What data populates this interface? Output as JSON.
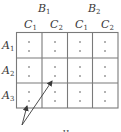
{
  "diagram": {
    "top_headers": [
      {
        "letter": "B",
        "sub": "1"
      },
      {
        "letter": "B",
        "sub": "2"
      }
    ],
    "sub_headers": [
      {
        "letter": "C",
        "sub": "1"
      },
      {
        "letter": "C",
        "sub": "2"
      },
      {
        "letter": "C",
        "sub": "1"
      },
      {
        "letter": "C",
        "sub": "2"
      }
    ],
    "row_headers": [
      {
        "letter": "A",
        "sub": "1"
      },
      {
        "letter": "A",
        "sub": "2"
      },
      {
        "letter": "A",
        "sub": "3"
      }
    ],
    "grid": {
      "rows": 3,
      "cols": 4,
      "dots_per_cell": 2,
      "line_color": "#7a7a7a",
      "dot_color": "#9a9a9a"
    },
    "annotation": {
      "text_partial": "",
      "arrows_to": [
        "A3-C1 (B1) cell",
        "A2-C2 (B1) cell"
      ]
    }
  }
}
